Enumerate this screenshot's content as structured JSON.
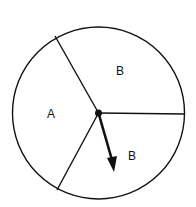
{
  "diagram": {
    "type": "spinner",
    "sections": [
      {
        "label": "B",
        "position": "upper-right"
      },
      {
        "label": "A",
        "position": "left"
      },
      {
        "label": "B",
        "position": "lower-right"
      }
    ],
    "pointer": {
      "points_to": "B"
    },
    "colors": {
      "stroke": "#111111",
      "background": "#ffffff"
    }
  }
}
